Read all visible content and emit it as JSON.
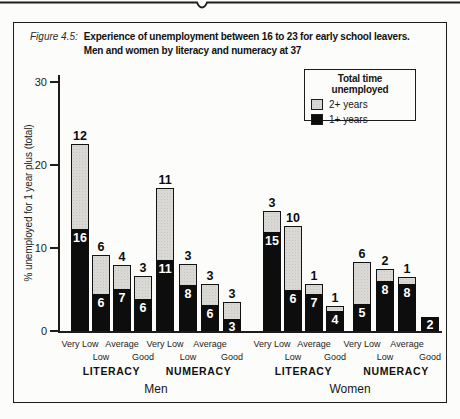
{
  "figure": {
    "label": "Figure 4.5:"
  },
  "legend": {
    "title": "Total time unemployed",
    "items": [
      {
        "label": "2+ years",
        "color": "#d9d8d4"
      },
      {
        "label": "1+ years",
        "color": "#0d0d0d"
      }
    ]
  },
  "chart_data": {
    "type": "bar",
    "stacked": true,
    "title_line1": "Experience of unemployment between 16 to 23 for early school leavers.",
    "title_line2": "Men and women by literacy and numeracy at 37",
    "ylabel": "% unemployed for 1 year plus (total)",
    "ylim": [
      0,
      30
    ],
    "yticks": [
      0,
      10,
      20,
      30
    ],
    "grid": false,
    "legend_position": "top-right",
    "segment_colors": {
      "one_plus_years": "#0d0d0d",
      "two_plus_years": "#d9d8d4"
    },
    "categories": [
      "Very Low",
      "Low",
      "Average",
      "Good"
    ],
    "sections": [
      {
        "label": "Men"
      },
      {
        "label": "Women"
      }
    ],
    "groups": [
      {
        "section": "Men",
        "skill": "LITERACY",
        "bars": [
          {
            "category": "Very Low",
            "total_pct": 22.5,
            "one_plus_pct": 12.3,
            "two_plus_pct": 10.2,
            "label_above": "12",
            "label_inside": "16"
          },
          {
            "category": "Low",
            "total_pct": 9.2,
            "one_plus_pct": 4.4,
            "two_plus_pct": 4.8,
            "label_above": "6",
            "label_inside": "6"
          },
          {
            "category": "Average",
            "total_pct": 8.0,
            "one_plus_pct": 5.0,
            "two_plus_pct": 3.0,
            "label_above": "4",
            "label_inside": "7"
          },
          {
            "category": "Good",
            "total_pct": 6.6,
            "one_plus_pct": 3.8,
            "two_plus_pct": 2.8,
            "label_above": "3",
            "label_inside": "6"
          }
        ]
      },
      {
        "section": "Men",
        "skill": "NUMERACY",
        "bars": [
          {
            "category": "Very Low",
            "total_pct": 17.2,
            "one_plus_pct": 8.6,
            "two_plus_pct": 8.6,
            "label_above": "11",
            "label_inside": "11"
          },
          {
            "category": "Low",
            "total_pct": 8.1,
            "one_plus_pct": 5.5,
            "two_plus_pct": 2.6,
            "label_above": "3",
            "label_inside": "8"
          },
          {
            "category": "Average",
            "total_pct": 5.7,
            "one_plus_pct": 3.1,
            "two_plus_pct": 2.6,
            "label_above": "3",
            "label_inside": "6"
          },
          {
            "category": "Good",
            "total_pct": 3.5,
            "one_plus_pct": 1.4,
            "two_plus_pct": 2.1,
            "label_above": "3",
            "label_inside": "3"
          }
        ]
      },
      {
        "section": "Women",
        "skill": "LITERACY",
        "bars": [
          {
            "category": "Very Low",
            "total_pct": 14.5,
            "one_plus_pct": 11.9,
            "two_plus_pct": 2.6,
            "label_above": "3",
            "label_inside": "15"
          },
          {
            "category": "Low",
            "total_pct": 12.6,
            "one_plus_pct": 4.9,
            "two_plus_pct": 7.7,
            "label_above": "10",
            "label_inside": "6"
          },
          {
            "category": "Average",
            "total_pct": 5.7,
            "one_plus_pct": 4.4,
            "two_plus_pct": 1.3,
            "label_above": "1",
            "label_inside": "7"
          },
          {
            "category": "Good",
            "total_pct": 3.0,
            "one_plus_pct": 2.4,
            "two_plus_pct": 0.6,
            "label_above": "1",
            "label_inside": "4"
          }
        ]
      },
      {
        "section": "Women",
        "skill": "NUMERACY",
        "bars": [
          {
            "category": "Very Low",
            "total_pct": 8.3,
            "one_plus_pct": 3.2,
            "two_plus_pct": 5.1,
            "label_above": "6",
            "label_inside": "5"
          },
          {
            "category": "Low",
            "total_pct": 7.5,
            "one_plus_pct": 6.0,
            "two_plus_pct": 1.5,
            "label_above": "2",
            "label_inside": "8"
          },
          {
            "category": "Average",
            "total_pct": 6.5,
            "one_plus_pct": 5.7,
            "two_plus_pct": 0.8,
            "label_above": "1",
            "label_inside": "8"
          },
          {
            "category": "Good",
            "total_pct": 1.7,
            "one_plus_pct": 1.7,
            "two_plus_pct": 0.0,
            "label_above": "",
            "label_inside": "2"
          }
        ]
      }
    ]
  }
}
